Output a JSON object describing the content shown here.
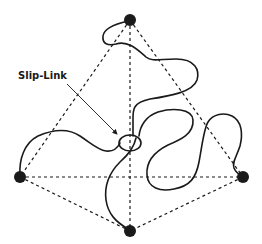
{
  "diagram": {
    "label": {
      "text": "Slip-Link",
      "x": 18,
      "y": 70
    },
    "colors": {
      "line": "#1a1a1a",
      "node": "#1a1a1a",
      "background": "#ffffff"
    },
    "nodes": [
      {
        "id": "top",
        "x": 130,
        "y": 20
      },
      {
        "id": "left",
        "x": 20,
        "y": 177
      },
      {
        "id": "right",
        "x": 243,
        "y": 177
      },
      {
        "id": "bottom",
        "x": 130,
        "y": 231
      }
    ],
    "dashed_edges": [
      [
        "top",
        "left"
      ],
      [
        "top",
        "right"
      ],
      [
        "top",
        "bottom"
      ],
      [
        "left",
        "right"
      ],
      [
        "left",
        "bottom"
      ],
      [
        "right",
        "bottom"
      ]
    ],
    "slip_link": {
      "cx": 130,
      "cy": 143,
      "rx": 11,
      "ry": 8
    }
  }
}
